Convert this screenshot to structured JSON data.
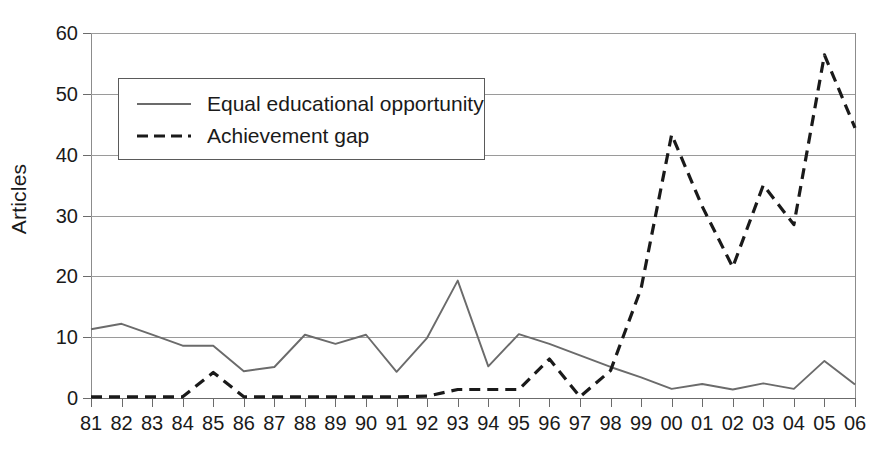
{
  "chart_data": {
    "type": "line",
    "title": "",
    "xlabel": "",
    "ylabel": "Articles",
    "ylim": [
      0,
      60
    ],
    "ytick_step": 10,
    "yticks": [
      0,
      10,
      20,
      30,
      40,
      50,
      60
    ],
    "grid": true,
    "legend_position": "upper-left-inside",
    "categories": [
      "81",
      "82",
      "83",
      "84",
      "85",
      "86",
      "87",
      "88",
      "89",
      "90",
      "91",
      "92",
      "93",
      "94",
      "95",
      "96",
      "97",
      "98",
      "99",
      "00",
      "01",
      "02",
      "03",
      "04",
      "05",
      "06"
    ],
    "series": [
      {
        "name": "Equal educational opportunity",
        "style": "solid",
        "color": "#6b6b6b",
        "values": [
          11.3,
          12.2,
          10.4,
          8.6,
          8.6,
          4.4,
          5.1,
          10.4,
          8.9,
          10.4,
          4.3,
          9.9,
          19.3,
          5.2,
          10.5,
          8.9,
          7.0,
          5.1,
          3.4,
          1.5,
          2.3,
          1.4,
          2.4,
          1.5,
          6.1,
          2.2
        ]
      },
      {
        "name": "Achievement gap",
        "style": "dashed",
        "color": "#1a1a1a",
        "values": [
          0.2,
          0.2,
          0.2,
          0.2,
          4.2,
          0.2,
          0.2,
          0.2,
          0.2,
          0.2,
          0.2,
          0.3,
          1.4,
          1.4,
          1.4,
          6.4,
          0.2,
          4.5,
          18.0,
          43.3,
          31.5,
          21.5,
          35.0,
          28.5,
          56.4,
          44.4
        ]
      }
    ]
  },
  "legend": {
    "entries": [
      {
        "label": "Equal educational opportunity",
        "style": "solid"
      },
      {
        "label": "Achievement gap",
        "style": "dashed"
      }
    ]
  },
  "axes": {
    "y_title": "Articles"
  }
}
